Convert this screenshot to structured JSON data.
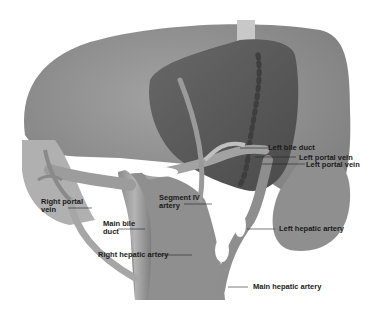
{
  "figure": {
    "colors": {
      "background": "#ffffff",
      "liver_right": "#8e8e8e",
      "liver_left_lobe": "#5a5a5a",
      "vessels": "#9a9a9a",
      "vessel_highlight": "#c4c4c4",
      "label_text": "#1a1a1a"
    },
    "labels": {
      "left_bile_duct": "Left bile duct",
      "left_portal_vein_1": "Left portal vein",
      "left_portal_vein_2": "Left portal vein",
      "right_portal_vein_line1": "Right portal",
      "right_portal_vein_line2": "vein",
      "segment_iv_line1": "Segment IV",
      "segment_iv_line2": "artery",
      "main_bile_duct_line1": "Main bile",
      "main_bile_duct_line2": "duct",
      "right_hepatic_artery": "Right hepatic artery",
      "left_hepatic_artery": "Left hepatic artery",
      "main_hepatic_artery": "Main hepatic artery"
    }
  }
}
